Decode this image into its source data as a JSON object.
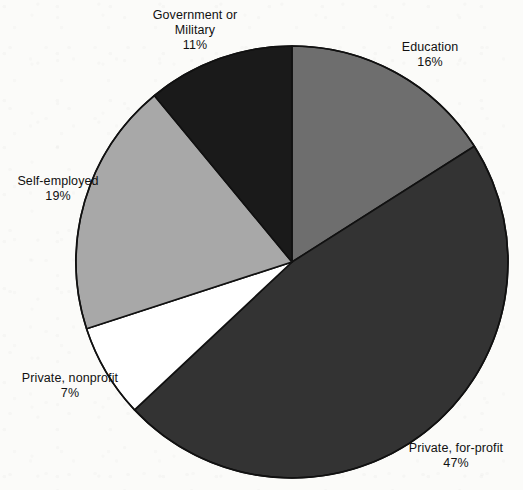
{
  "chart_data": {
    "type": "pie",
    "title": "",
    "subtitle": "",
    "xlabel": "",
    "ylabel": "",
    "legend_position": "none",
    "grid": false,
    "start_angle_deg": 0,
    "direction": "clockwise",
    "units": "percent",
    "categories": [
      "Education",
      "Private, for-profit",
      "Private, nonprofit",
      "Self-employed",
      "Government or Military"
    ],
    "values": [
      16,
      47,
      7,
      19,
      11
    ],
    "slices": [
      {
        "label": "Education",
        "label_line1": "Education",
        "label_line2": "16%",
        "value": 16,
        "percent_text": "16%",
        "color": "#6e6e6e",
        "start_angle_deg": 0,
        "end_angle_deg": 57.6
      },
      {
        "label": "Private, for-profit",
        "label_line1": "Private, for-profit",
        "label_line2": "47%",
        "value": 47,
        "percent_text": "47%",
        "color": "#333333",
        "start_angle_deg": 57.6,
        "end_angle_deg": 226.8
      },
      {
        "label": "Private, nonprofit",
        "label_line1": "Private, nonprofit",
        "label_line2": "7%",
        "value": 7,
        "percent_text": "7%",
        "color": "#ffffff",
        "start_angle_deg": 226.8,
        "end_angle_deg": 252.0
      },
      {
        "label": "Self-employed",
        "label_line1": "Self-employed",
        "label_line2": "19%",
        "value": 19,
        "percent_text": "19%",
        "color": "#a8a8a8",
        "start_angle_deg": 252.0,
        "end_angle_deg": 320.4
      },
      {
        "label": "Government or Military",
        "label_line1": "Government or",
        "label_line1b": "Military",
        "label_line2": "11%",
        "value": 11,
        "percent_text": "11%",
        "color": "#1a1a1a",
        "start_angle_deg": 320.4,
        "end_angle_deg": 360.0
      }
    ],
    "geometry": {
      "center_x": 292,
      "center_y": 262,
      "radius": 216
    },
    "colors": {
      "background": "#fbfbf9",
      "outline": "#111111",
      "education": "#6e6e6e",
      "private_for_profit": "#333333",
      "private_nonprofit": "#ffffff",
      "self_employed": "#a8a8a8",
      "government_or_military": "#1a1a1a"
    }
  }
}
